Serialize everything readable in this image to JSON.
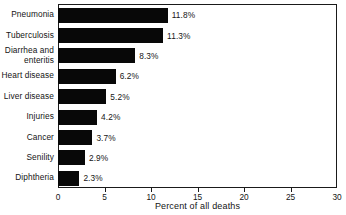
{
  "chart_data": {
    "type": "bar",
    "orientation": "horizontal",
    "title": "",
    "xlabel": "Percent of all deaths",
    "ylabel": "",
    "xlim": [
      0,
      30
    ],
    "xticks": [
      0,
      5,
      10,
      15,
      20,
      25,
      30
    ],
    "xtick_labels": [
      "0",
      "5",
      "10",
      "15",
      "20",
      "25",
      "30"
    ],
    "grid": false,
    "legend": false,
    "bar_color": "#080808",
    "categories": [
      "Pneumonia",
      "Tuberculosis",
      "Diarrhea and\nenteritis",
      "Heart disease",
      "Liver disease",
      "Injuries",
      "Cancer",
      "Senility",
      "Diphtheria"
    ],
    "values": [
      11.8,
      11.3,
      8.3,
      6.2,
      5.2,
      4.2,
      3.7,
      2.9,
      2.3
    ],
    "value_labels": [
      "11.8%",
      "11.3%",
      "8.3%",
      "6.2%",
      "5.2%",
      "4.2%",
      "3.7%",
      "2.9%",
      "2.3%"
    ]
  }
}
